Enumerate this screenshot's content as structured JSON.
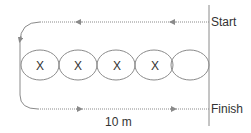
{
  "diagram": {
    "start_label": "Start",
    "finish_label": "Finish",
    "distance_label": "10 m",
    "cone_marker": "X",
    "cones": [
      "X",
      "X",
      "X",
      "X",
      ""
    ],
    "colors": {
      "line": "#8a8a8a",
      "text": "#333333"
    }
  }
}
